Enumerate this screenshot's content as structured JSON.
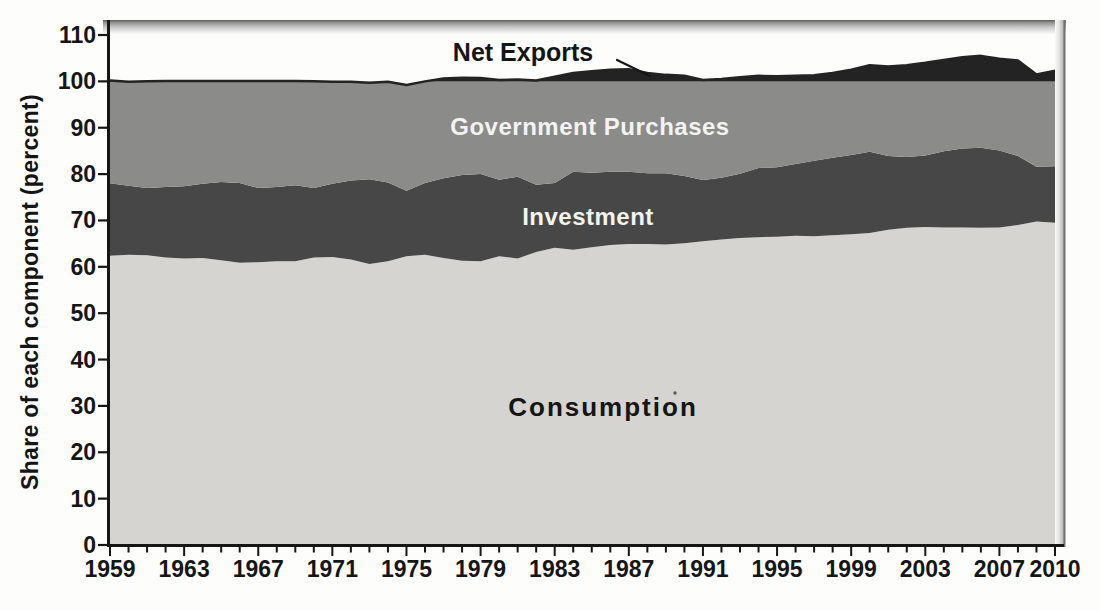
{
  "figure": {
    "y_axis_title": "Share of each component (percent)",
    "labels": {
      "net_exports": "Net Exports",
      "government": "Government Purchases",
      "investment": "Investment",
      "consumption": "Consumption"
    },
    "colors": {
      "consumption": "#d5d4d1",
      "investment": "#474747",
      "government": "#8b8b89",
      "net_exports": "#232323",
      "axis": "#161616",
      "background": "#fdfdfc"
    }
  },
  "chart_data": {
    "type": "area",
    "stacked": true,
    "title": "",
    "xlabel": "",
    "ylabel": "Share of each component (percent)",
    "ylim": [
      0,
      110
    ],
    "y_ticks": [
      0,
      10,
      20,
      30,
      40,
      50,
      60,
      70,
      80,
      90,
      100,
      110
    ],
    "x": [
      1959,
      1960,
      1961,
      1962,
      1963,
      1964,
      1965,
      1966,
      1967,
      1968,
      1969,
      1970,
      1971,
      1972,
      1973,
      1974,
      1975,
      1976,
      1977,
      1978,
      1979,
      1980,
      1981,
      1982,
      1983,
      1984,
      1985,
      1986,
      1987,
      1988,
      1989,
      1990,
      1991,
      1992,
      1993,
      1994,
      1995,
      1996,
      1997,
      1998,
      1999,
      2000,
      2001,
      2002,
      2003,
      2004,
      2005,
      2006,
      2007,
      2008,
      2009,
      2010
    ],
    "x_tick_labels": [
      1959,
      1963,
      1967,
      1971,
      1975,
      1979,
      1983,
      1987,
      1991,
      1995,
      1999,
      2003,
      2007,
      2010
    ],
    "grid": false,
    "legend_position": "labels drawn inside each band",
    "series": [
      {
        "name": "Consumption",
        "values": [
          62.4,
          62.6,
          62.5,
          62.0,
          61.8,
          61.9,
          61.4,
          60.9,
          61.0,
          61.2,
          61.2,
          62.0,
          62.1,
          61.6,
          60.6,
          61.2,
          62.3,
          62.6,
          61.9,
          61.3,
          61.2,
          62.3,
          61.8,
          63.2,
          64.1,
          63.7,
          64.2,
          64.7,
          64.9,
          64.9,
          64.8,
          65.1,
          65.5,
          65.9,
          66.2,
          66.4,
          66.5,
          66.7,
          66.6,
          66.8,
          67.0,
          67.3,
          68.0,
          68.4,
          68.6,
          68.5,
          68.5,
          68.4,
          68.5,
          69.0,
          69.8,
          69.5
        ]
      },
      {
        "name": "Investment",
        "values": [
          15.6,
          14.9,
          14.5,
          15.2,
          15.6,
          16.0,
          16.9,
          17.2,
          16.0,
          16.0,
          16.4,
          15.0,
          15.8,
          17.0,
          18.3,
          17.0,
          14.1,
          15.5,
          17.2,
          18.5,
          18.8,
          16.5,
          17.6,
          14.5,
          14.0,
          16.8,
          16.1,
          15.8,
          15.6,
          15.3,
          15.4,
          14.5,
          13.2,
          13.3,
          13.9,
          14.9,
          15.0,
          15.5,
          16.3,
          16.7,
          17.1,
          17.5,
          15.9,
          15.3,
          15.4,
          16.4,
          17.0,
          17.3,
          16.6,
          14.9,
          11.8,
          12.2
        ]
      },
      {
        "name": "Government Purchases",
        "values": [
          22.2,
          22.4,
          23.0,
          22.9,
          22.7,
          22.2,
          21.8,
          22.0,
          23.1,
          22.9,
          22.5,
          23.0,
          22.0,
          21.3,
          20.8,
          21.7,
          22.8,
          21.9,
          21.5,
          21.0,
          20.7,
          21.5,
          21.0,
          22.5,
          22.9,
          21.3,
          21.9,
          22.0,
          22.1,
          21.6,
          21.2,
          21.6,
          21.6,
          21.3,
          20.8,
          19.9,
          19.6,
          19.0,
          18.4,
          18.3,
          18.4,
          18.7,
          19.3,
          19.8,
          20.0,
          19.7,
          19.7,
          19.8,
          19.8,
          20.6,
          19.9,
          20.6
        ]
      },
      {
        "name": "Net Exports",
        "values": [
          -0.2,
          0.1,
          0.0,
          -0.1,
          -0.1,
          -0.1,
          -0.1,
          -0.1,
          -0.1,
          -0.1,
          -0.1,
          0.0,
          0.1,
          0.1,
          0.3,
          0.1,
          0.8,
          0.0,
          -0.6,
          -0.8,
          -0.7,
          -0.3,
          -0.4,
          -0.2,
          -1.0,
          -1.8,
          -2.2,
          -2.5,
          -2.6,
          -1.8,
          -1.4,
          -1.2,
          -0.3,
          -0.5,
          -0.9,
          -1.2,
          -1.1,
          -1.2,
          -1.3,
          -1.8,
          -2.5,
          -3.5,
          -3.2,
          -3.5,
          -4.0,
          -4.6,
          -5.2,
          -5.5,
          -4.9,
          -4.5,
          -1.5,
          -2.3
        ]
      }
    ],
    "drawing_note": "Bands stacked bottom-up: Consumption, Investment, Government Purchases; the Net Exports band is the dark sliver between the 100% line and the C+I+G total (above 100 when net exports are negative)."
  }
}
